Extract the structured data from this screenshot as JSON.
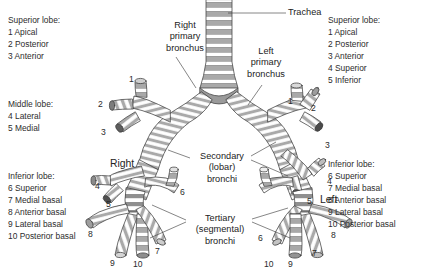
{
  "figure": {
    "background_color": "#ffffff",
    "ink_color": "#2d2d2d",
    "tube_fill": "#ffffff",
    "ring_fill": "#a9a9a9",
    "ring_fill_dark": "#6e6e6e",
    "outline_color": "#3a3a3a"
  },
  "legends": {
    "right_superior": {
      "header": "Superior lobe:",
      "items": [
        "1 Apical",
        "2 Posterior",
        "3 Anterior"
      ]
    },
    "right_middle": {
      "header": "Middle lobe:",
      "items": [
        "4 Lateral",
        "5 Medial"
      ]
    },
    "right_inferior": {
      "header": "Inferior lobe:",
      "items": [
        "6 Superior",
        "7 Medial basal",
        "8 Anterior basal",
        "9  Lateral basal",
        "10 Posterior basal"
      ]
    },
    "left_superior": {
      "header": "Superior lobe:",
      "items": [
        "1 Apical",
        "2 Posterior",
        "3 Anterior",
        "4 Superior",
        "5 Inferior"
      ]
    },
    "left_inferior": {
      "header": "Inferior lobe:",
      "items": [
        "6 Superior",
        "7 Medial basal",
        "8 Anterior basal",
        "9  Lateral basal",
        "10 Posterior basal"
      ]
    }
  },
  "callouts": {
    "trachea": "Trachea",
    "right_primary_bronchus": [
      "Right",
      "primary",
      "bronchus"
    ],
    "left_primary_bronchus": [
      "Left",
      "primary",
      "bronchus"
    ],
    "secondary_bronchi": [
      "Secondary",
      "(lobar)",
      "bronchi"
    ],
    "tertiary_bronchi": [
      "Tertiary",
      "(segmental)",
      "bronchi"
    ],
    "side_right": "Right",
    "side_left": "Left"
  },
  "segment_numbers": {
    "right_lung": [
      {
        "label": "1",
        "x": 129,
        "y": 74
      },
      {
        "label": "2",
        "x": 98,
        "y": 99
      },
      {
        "label": "3",
        "x": 101,
        "y": 127
      },
      {
        "label": "4",
        "x": 95,
        "y": 181
      },
      {
        "label": "5",
        "x": 106,
        "y": 199
      },
      {
        "label": "8",
        "x": 88,
        "y": 229
      },
      {
        "label": "9",
        "x": 110,
        "y": 258
      },
      {
        "label": "10",
        "x": 133,
        "y": 259
      },
      {
        "label": "7",
        "x": 155,
        "y": 246
      },
      {
        "label": "6",
        "x": 180,
        "y": 187
      }
    ],
    "left_lung": [
      {
        "label": "1",
        "x": 288,
        "y": 96
      },
      {
        "label": "2",
        "x": 311,
        "y": 103
      },
      {
        "label": "3",
        "x": 325,
        "y": 140
      },
      {
        "label": "4",
        "x": 327,
        "y": 176
      },
      {
        "label": "5",
        "x": 307,
        "y": 196
      },
      {
        "label": "8",
        "x": 331,
        "y": 230
      },
      {
        "label": "7",
        "x": 312,
        "y": 248
      },
      {
        "label": "9",
        "x": 288,
        "y": 259
      },
      {
        "label": "10",
        "x": 264,
        "y": 259
      },
      {
        "label": "6",
        "x": 258,
        "y": 233
      }
    ]
  }
}
